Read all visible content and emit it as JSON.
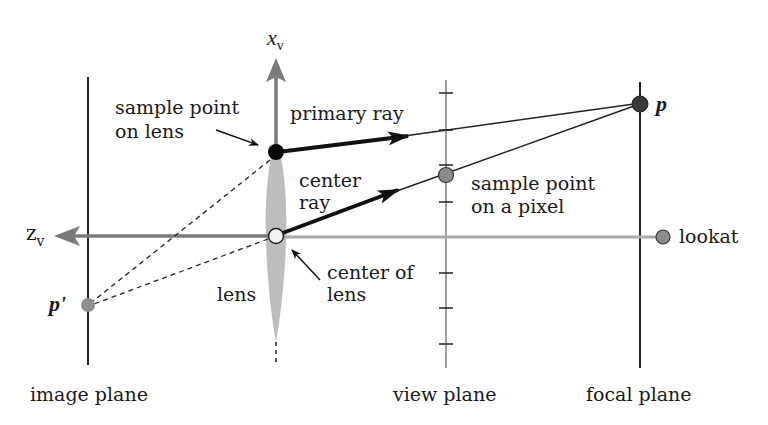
{
  "diagram": {
    "colors": {
      "background": "#ffffff",
      "ink": "#111111",
      "axis_gray": "#7a7a7a",
      "light_axis": "#a9a9a9",
      "lens_fill": "#bdbdbd",
      "point_dark": "#3a3a3a",
      "point_gray": "#8c8c8c",
      "point_open": "#f2f2f2"
    },
    "axes": {
      "x_axis_label": "x",
      "x_axis_subscript": "v",
      "z_axis_label": "z",
      "z_axis_subscript": "v"
    },
    "planes": {
      "image_plane": "image plane",
      "view_plane": "view plane",
      "focal_plane": "focal plane"
    },
    "points": {
      "p": "p",
      "p_prime": "p'",
      "lookat": "lookat"
    },
    "labels": {
      "sample_point_on_lens_line1": "sample point",
      "sample_point_on_lens_line2": "on lens",
      "primary_ray": "primary ray",
      "center_ray_line1": "center",
      "center_ray_line2": "ray",
      "sample_point_pixel_line1": "sample point",
      "sample_point_pixel_line2": "on a pixel",
      "center_of_lens_line1": "center of",
      "center_of_lens_line2": "lens",
      "lens": "lens"
    }
  }
}
